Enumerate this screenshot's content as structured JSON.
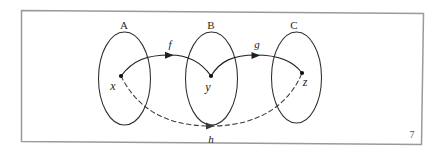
{
  "figure": {
    "caption_number": "7",
    "sets": [
      {
        "label": "A",
        "cx": 124.5,
        "cy": 78.5,
        "rx": 26,
        "ry": 46.5,
        "label_x": 124,
        "label_y": 29
      },
      {
        "label": "B",
        "cx": 211.5,
        "cy": 78.5,
        "rx": 26,
        "ry": 46.5,
        "label_x": 211,
        "label_y": 29
      },
      {
        "label": "C",
        "cx": 296.5,
        "cy": 77.5,
        "rx": 25,
        "ry": 45.5,
        "label_x": 294,
        "label_y": 29
      }
    ],
    "elements": [
      {
        "label": "x",
        "x": 121,
        "y": 76,
        "label_x": 113,
        "label_y": 90
      },
      {
        "label": "y",
        "x": 211,
        "y": 76,
        "label_x": 208,
        "label_y": 91
      },
      {
        "label": "z",
        "x": 302,
        "y": 73,
        "label_x": 305,
        "label_y": 86
      }
    ],
    "maps": [
      {
        "label": "f",
        "from": "x",
        "to": "y",
        "style": "solid",
        "label_x": 170,
        "label_y": 48,
        "path": "M 121,76 C 133,60 147,55 170,55 C 190,55 202,63 211,76",
        "arrow_x": 171.5,
        "arrow_y": 55.2,
        "arrow_angle": 0
      },
      {
        "label": "g",
        "from": "y",
        "to": "z",
        "style": "solid",
        "label_x": 257,
        "label_y": 48,
        "path": "M 211,76 C 220,61 233,55 256,55 C 278,55 294,62 302,73",
        "arrow_x": 258,
        "arrow_y": 55.3,
        "arrow_angle": 2
      },
      {
        "label": "h",
        "from": "x",
        "to": "z",
        "style": "dashed",
        "label_x": 211,
        "label_y": 143,
        "path": "M 121,76 C 135,104 160,126 211,126 C 262,126 290,102 302,73",
        "arrow_x": 213,
        "arrow_y": 126,
        "arrow_angle": 0
      }
    ],
    "frame": {
      "path": "M 21.5,10.5 L 423.5,13.5 L 421.5,144.5 L 21.5,141.5 Z"
    }
  }
}
